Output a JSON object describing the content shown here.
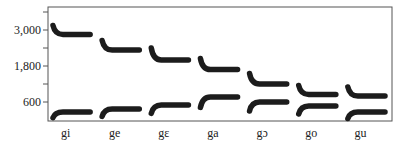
{
  "chart_data": {
    "type": "line",
    "title": "",
    "xlabel": "",
    "ylabel": "",
    "ylim": [
      0,
      3750
    ],
    "grid": false,
    "legend": null,
    "yticks_major": [
      600,
      1800,
      3000
    ],
    "yticks_minor": [
      1200,
      2400,
      3600
    ],
    "ytick_labels": [
      "600",
      "1,800",
      "3,000"
    ],
    "categories": [
      "gi",
      "ge",
      "gɛ",
      "ga",
      "gɔ",
      "go",
      "gu"
    ],
    "series": [
      {
        "name": "F2",
        "onset": [
          3150,
          2650,
          2400,
          2050,
          1550,
          1150,
          1100
        ],
        "values": [
          2850,
          2330,
          2000,
          1680,
          1200,
          850,
          800
        ]
      },
      {
        "name": "F1",
        "onset": [
          80,
          120,
          220,
          420,
          300,
          200,
          50
        ],
        "values": [
          270,
          370,
          500,
          770,
          600,
          470,
          270
        ]
      }
    ],
    "annotations": "Stylized formant patterns (F1 and F2 bands) for [g] + vowel syllables"
  }
}
